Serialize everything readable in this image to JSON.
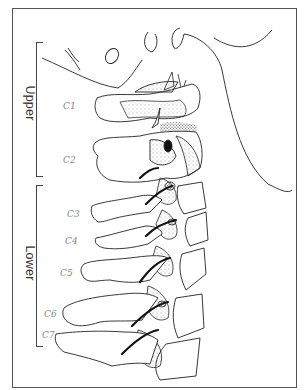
{
  "figure": {
    "regions": [
      {
        "id": "upper",
        "label": "Upper"
      },
      {
        "id": "lower",
        "label": "Lower"
      }
    ],
    "vertebrae": [
      {
        "id": "c1",
        "label": "C1",
        "region": "upper"
      },
      {
        "id": "c2",
        "label": "C2",
        "region": "upper"
      },
      {
        "id": "c3",
        "label": "C3",
        "region": "lower"
      },
      {
        "id": "c4",
        "label": "C4",
        "region": "lower"
      },
      {
        "id": "c5",
        "label": "C5",
        "region": "lower"
      },
      {
        "id": "c6",
        "label": "C6",
        "region": "lower"
      },
      {
        "id": "c7",
        "label": "C7",
        "region": "lower"
      }
    ],
    "colors": {
      "line": "#222222",
      "frame": "#555555",
      "label": "#888888",
      "background": "#ffffff"
    }
  }
}
